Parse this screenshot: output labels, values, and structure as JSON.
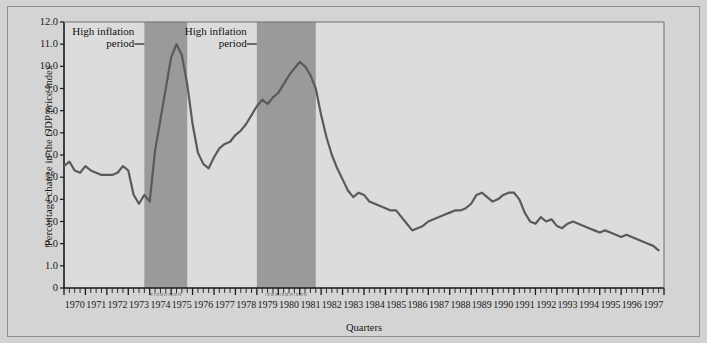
{
  "figure": {
    "background_color": "#d4d4d4",
    "plot_background_color": "#dcdcdc",
    "band_color": "#9a9a9a",
    "line_color": "#5a5a5a",
    "axis_color": "#1a1a1a"
  },
  "annotations": [
    {
      "name": "high-inflation-period-1",
      "line1": "High inflation",
      "line2": "period",
      "dash": "—"
    },
    {
      "name": "high-inflation-period-2",
      "line1": "High inflation",
      "line2": "period",
      "dash": "—"
    }
  ],
  "quarter_marks": {
    "band1": "IV I II III IV I II III IV",
    "band2": "I II III IV I II III IV I II III IV"
  },
  "chart_data": {
    "type": "line",
    "title": "",
    "xlabel": "Quarters",
    "ylabel": "Percentage change in the GDP price index",
    "ylim": [
      0,
      12
    ],
    "yticks": [
      0,
      1.0,
      2.0,
      3.0,
      4.0,
      5.0,
      6.0,
      7.0,
      8.0,
      9.0,
      10.0,
      11.0,
      12.0
    ],
    "ytick_labels": [
      "0",
      "1.0",
      "2.0",
      "3.0",
      "4.0",
      "5.0",
      "6.0",
      "7.0",
      "8.0",
      "9.0",
      "10.0",
      "11.0",
      "12.0"
    ],
    "xlim": [
      1970.0,
      1998.0
    ],
    "xtick_labels": [
      "1970",
      "1971",
      "1972",
      "1973",
      "1974",
      "1975",
      "1976",
      "1977",
      "1978",
      "1979",
      "1980",
      "1981",
      "1982",
      "1983",
      "1984",
      "1985",
      "1986",
      "1987",
      "1988",
      "1989",
      "1990",
      "1991",
      "1992",
      "1993",
      "1994",
      "1995",
      "1996",
      "1997"
    ],
    "grid": false,
    "legend": "none",
    "shaded_regions": [
      {
        "label": "High inflation period",
        "x_start": 1973.75,
        "x_end": 1975.75
      },
      {
        "label": "High inflation period",
        "x_start": 1979.0,
        "x_end": 1981.75
      }
    ],
    "series": [
      {
        "name": "Percentage change in the GDP price index",
        "x": [
          1970.0,
          1970.25,
          1970.5,
          1970.75,
          1971.0,
          1971.25,
          1971.5,
          1971.75,
          1972.0,
          1972.25,
          1972.5,
          1972.75,
          1973.0,
          1973.25,
          1973.5,
          1973.75,
          1974.0,
          1974.25,
          1974.5,
          1974.75,
          1975.0,
          1975.25,
          1975.5,
          1975.75,
          1976.0,
          1976.25,
          1976.5,
          1976.75,
          1977.0,
          1977.25,
          1977.5,
          1977.75,
          1978.0,
          1978.25,
          1978.5,
          1978.75,
          1979.0,
          1979.25,
          1979.5,
          1979.75,
          1980.0,
          1980.25,
          1980.5,
          1980.75,
          1981.0,
          1981.25,
          1981.5,
          1981.75,
          1982.0,
          1982.25,
          1982.5,
          1982.75,
          1983.0,
          1983.25,
          1983.5,
          1983.75,
          1984.0,
          1984.25,
          1984.5,
          1984.75,
          1985.0,
          1985.25,
          1985.5,
          1985.75,
          1986.0,
          1986.25,
          1986.5,
          1986.75,
          1987.0,
          1987.25,
          1987.5,
          1987.75,
          1988.0,
          1988.25,
          1988.5,
          1988.75,
          1989.0,
          1989.25,
          1989.5,
          1989.75,
          1990.0,
          1990.25,
          1990.5,
          1990.75,
          1991.0,
          1991.25,
          1991.5,
          1991.75,
          1992.0,
          1992.25,
          1992.5,
          1992.75,
          1993.0,
          1993.25,
          1993.5,
          1993.75,
          1994.0,
          1994.25,
          1994.5,
          1994.75,
          1995.0,
          1995.25,
          1995.5,
          1995.75,
          1996.0,
          1996.25,
          1996.5,
          1996.75,
          1997.0,
          1997.25,
          1997.5,
          1997.75
        ],
        "y": [
          5.5,
          5.7,
          5.3,
          5.2,
          5.5,
          5.3,
          5.2,
          5.1,
          5.1,
          5.1,
          5.2,
          5.5,
          5.3,
          4.2,
          3.8,
          4.2,
          3.9,
          6.2,
          7.6,
          9.0,
          10.4,
          11.0,
          10.5,
          9.2,
          7.4,
          6.1,
          5.6,
          5.4,
          5.9,
          6.3,
          6.5,
          6.6,
          6.9,
          7.1,
          7.4,
          7.8,
          8.2,
          8.5,
          8.3,
          8.6,
          8.8,
          9.2,
          9.6,
          9.9,
          10.2,
          10.0,
          9.6,
          9.0,
          7.8,
          6.8,
          6.0,
          5.4,
          4.9,
          4.4,
          4.1,
          4.3,
          4.2,
          3.9,
          3.8,
          3.7,
          3.6,
          3.5,
          3.5,
          3.2,
          2.9,
          2.6,
          2.7,
          2.8,
          3.0,
          3.1,
          3.2,
          3.3,
          3.4,
          3.5,
          3.5,
          3.6,
          3.8,
          4.2,
          4.3,
          4.1,
          3.9,
          4.0,
          4.2,
          4.3,
          4.3,
          4.0,
          3.4,
          3.0,
          2.9,
          3.2,
          3.0,
          3.1,
          2.8,
          2.7,
          2.9,
          3.0,
          2.9,
          2.8,
          2.7,
          2.6,
          2.5,
          2.6,
          2.5,
          2.4,
          2.3,
          2.4,
          2.3,
          2.2,
          2.1,
          2.0,
          1.9,
          1.7
        ]
      }
    ]
  }
}
